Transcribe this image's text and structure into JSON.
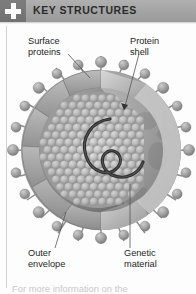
{
  "header": {
    "title": "KEY STRUCTURES",
    "icon": "plus-icon",
    "icon_box_color": "#717171",
    "bar_color": "#a3a3a3",
    "title_color": "#2b2b2b"
  },
  "figure": {
    "labels": {
      "surface_proteins": "Surface\nproteins",
      "protein_shell": "Protein\nshell",
      "outer_envelope": "Outer\nenvelope",
      "genetic_material": "Genetic\nmaterial"
    },
    "palette": {
      "envelope_dark": "#8a8a8a",
      "envelope_mid": "#a2a2a2",
      "envelope_light": "#c4c4c4",
      "capsid_sphere": "#cfcfcf",
      "capsid_shadow": "#8f8f8f",
      "spike_fill": "#9b9b9b",
      "genome_strand": "#2e2e2e",
      "leader_line": "#5a5a5a",
      "background": "#fdfdfd"
    }
  },
  "footer": {
    "caption": "For more information on the"
  }
}
